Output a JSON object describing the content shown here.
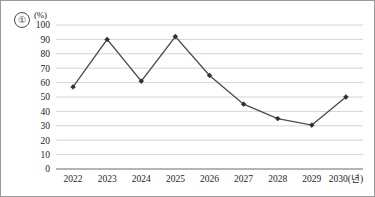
{
  "figure": {
    "item_number": "①",
    "unit_label": "(%)",
    "x_axis_suffix": "(년)",
    "border_color": "#9a9a9a",
    "gridline_color": "#c9c9c9",
    "axis_color": "#6d6d6d",
    "line_color": "#4d4d4d",
    "marker_color": "#2f2f2f"
  },
  "chart_data": {
    "type": "line",
    "title": "",
    "subtitle": "",
    "xlabel": "(년)",
    "ylabel": "(%)",
    "categories": [
      "2022",
      "2023",
      "2024",
      "2025",
      "2026",
      "2027",
      "2028",
      "2029",
      "2030"
    ],
    "values": [
      57,
      90,
      61,
      92,
      65,
      45,
      35,
      30.5,
      50
    ],
    "series": [
      {
        "name": "",
        "values": [
          57,
          90,
          61,
          92,
          65,
          45,
          35,
          30.5,
          50
        ]
      }
    ],
    "ylim": [
      0,
      100
    ],
    "ytick_labels": [
      "0",
      "10",
      "20",
      "30",
      "40",
      "50",
      "60",
      "70",
      "80",
      "90",
      "100"
    ],
    "ytick_values": [
      0,
      10,
      20,
      30,
      40,
      50,
      60,
      70,
      80,
      90,
      100
    ],
    "xtick_labels": [
      "2022",
      "2023",
      "2024",
      "2025",
      "2026",
      "2027",
      "2028",
      "2029",
      "2030(년)"
    ],
    "grid": true,
    "grid_axis": "y",
    "legend": false,
    "legend_position": "none",
    "markers": "diamond",
    "annotations": []
  }
}
